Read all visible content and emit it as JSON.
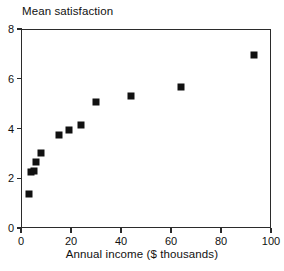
{
  "chart_data": {
    "type": "scatter",
    "title": "Mean satisfaction",
    "xlabel": "Annual income ($ thousands)",
    "ylabel": "Mean satisfaction",
    "xlim": [
      0,
      100
    ],
    "ylim": [
      0,
      8
    ],
    "xticks": [
      0,
      20,
      40,
      60,
      80,
      100
    ],
    "xticklabels": [
      "0",
      "20",
      "40",
      "60",
      "80",
      "100"
    ],
    "yticks": [
      0,
      2,
      4,
      6,
      8
    ],
    "yticklabels": [
      "0",
      "2",
      "4",
      "6",
      "8"
    ],
    "grid": false,
    "legend": null,
    "marker": "square",
    "marker_color": "#111111",
    "points": [
      {
        "x": 3,
        "y": 1.35
      },
      {
        "x": 4,
        "y": 2.25
      },
      {
        "x": 5,
        "y": 2.3
      },
      {
        "x": 6,
        "y": 2.65
      },
      {
        "x": 8,
        "y": 3.0
      },
      {
        "x": 15,
        "y": 3.75
      },
      {
        "x": 19,
        "y": 3.95
      },
      {
        "x": 24,
        "y": 4.15
      },
      {
        "x": 30,
        "y": 5.05
      },
      {
        "x": 44,
        "y": 5.3
      },
      {
        "x": 64,
        "y": 5.65
      },
      {
        "x": 93,
        "y": 6.95
      }
    ]
  },
  "colors": {
    "axis": "#2b2b2b",
    "marker": "#111111",
    "text": "#111111",
    "background": "#ffffff"
  }
}
